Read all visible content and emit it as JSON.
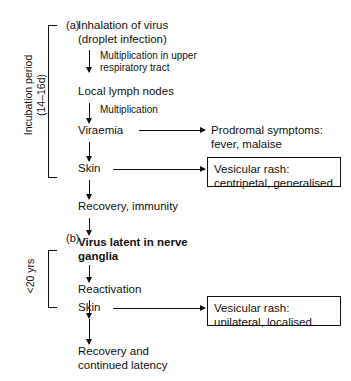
{
  "figure": {
    "type": "flowchart"
  },
  "panels": [
    {
      "id": "a",
      "label": "(a)",
      "bracket_label": "Incubation period\n(14–16d)"
    },
    {
      "id": "b",
      "label": "(b)",
      "bracket_label": "<20 yrs"
    }
  ],
  "nodes": {
    "inhalation": "Inhalation of virus\n(droplet infection)",
    "lymph_nodes": "Local lymph nodes",
    "viraemia": "Viraemia",
    "skin_a": "Skin",
    "recovery_immunity": "Recovery, immunity",
    "latent": "Virus latent in nerve\nganglia",
    "reactivation": "Reactivation",
    "skin_b": "Skin",
    "recovery_latency": "Recovery and\ncontinued latency"
  },
  "edge_labels": {
    "multiplication_upper": "Multiplication in upper\nrespiratory tract",
    "multiplication": "Multiplication"
  },
  "outcomes": {
    "prodromal": "Prodromal symptoms:\nfever, malaise",
    "rash_a": "Vesicular rash:\ncentripetal, generalised",
    "rash_b": "Vesicular rash:\nunilateral, localised"
  },
  "colors": {
    "ink": "#111111",
    "background": "#ffffff"
  }
}
